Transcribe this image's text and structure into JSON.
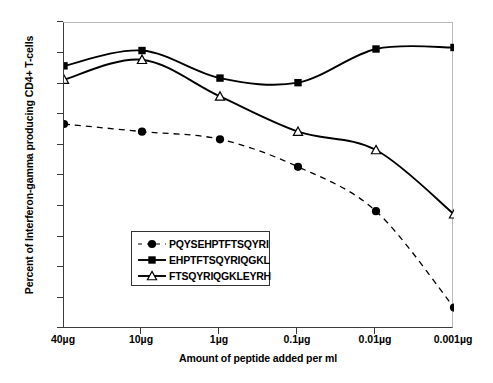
{
  "chart_data": {
    "type": "line",
    "title": "",
    "xlabel": "Amount of peptide added per ml",
    "ylabel": "Percent of Interferon-gamma producing CD4+ T-cells",
    "categories": [
      "40µg",
      "10µg",
      "1µg",
      "0.1µg",
      "0.01µg",
      "0.001µg"
    ],
    "ylim": [
      0.0,
      10.0
    ],
    "ytick_labels": [
      "0.0",
      "1.0",
      "2.0",
      "3.0",
      "4.0",
      "5.0",
      "6.0",
      "7.0",
      "8.0",
      "9.0",
      "10.0"
    ],
    "ytick_values": [
      0.0,
      1.0,
      2.0,
      3.0,
      4.0,
      5.0,
      6.0,
      7.0,
      8.0,
      9.0,
      10.0
    ],
    "grid": false,
    "legend_position": "center-left-inside",
    "series": [
      {
        "name": "PQYSEHPTFTSQYRI",
        "marker": "filled-circle",
        "line_style": "dashed",
        "color": "#000000",
        "values": [
          6.7,
          6.45,
          6.2,
          5.3,
          3.85,
          0.7
        ]
      },
      {
        "name": "EHPTFTSQYRIQGKL",
        "marker": "filled-square",
        "line_style": "solid",
        "color": "#000000",
        "values": [
          8.6,
          9.1,
          8.2,
          8.05,
          9.15,
          9.2
        ]
      },
      {
        "name": "FTSQYRIQGKLEYRH",
        "marker": "open-triangle",
        "line_style": "solid",
        "color": "#000000",
        "values": [
          8.15,
          8.8,
          7.6,
          6.45,
          5.85,
          3.75
        ]
      }
    ]
  },
  "legend": {
    "items": [
      {
        "label": "PQYSEHPTFTSQYRI"
      },
      {
        "label": "EHPTFTSQYRIQGKL"
      },
      {
        "label": "FTSQYRIQGKLEYRH"
      }
    ]
  },
  "axes": {
    "x_title": "Amount of peptide added per ml",
    "y_title": "Percent of Interferon-gamma producing CD4+ T-cells"
  },
  "colors": {
    "ink": "#000000",
    "frame_light": "#b8b8b8",
    "axis": "#3a3a3a",
    "background": "#ffffff"
  }
}
